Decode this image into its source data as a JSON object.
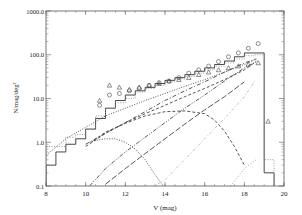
{
  "chart_data": {
    "type": "line",
    "title": "",
    "xlabel": "V (mag)",
    "ylabel": "N/mag/deg²",
    "xlim": [
      8,
      20
    ],
    "ylim": [
      0.1,
      1000.0
    ],
    "yscale": "log",
    "grid": false,
    "legend": null,
    "x_ticks": [
      "8",
      "10",
      "12",
      "14",
      "16",
      "18",
      "20"
    ],
    "y_ticks": [
      "0.1",
      "1.0",
      "10.0",
      "100.0",
      "1000.0"
    ],
    "series": [
      {
        "name": "observed histogram",
        "style": "solid-step",
        "bin_edges": [
          8.0,
          8.5,
          9.0,
          9.5,
          10.0,
          10.5,
          11.0,
          11.5,
          12.0,
          12.5,
          13.0,
          13.5,
          14.0,
          14.5,
          15.0,
          15.5,
          16.0,
          16.5,
          17.0,
          17.5,
          18.0,
          18.5,
          19.0,
          19.5
        ],
        "values": [
          0.3,
          0.6,
          0.9,
          1.2,
          2.0,
          3.5,
          6.0,
          9.0,
          12,
          15,
          18,
          22,
          26,
          30,
          35,
          42,
          50,
          60,
          72,
          90,
          110,
          110,
          0.2
        ]
      },
      {
        "name": "model total histogram",
        "style": "dotted-step",
        "bin_edges": [
          8.0,
          8.5,
          9.0,
          9.5,
          10.0,
          10.5,
          11.0,
          11.5,
          12.0,
          12.5,
          13.0,
          13.5,
          14.0,
          14.5,
          15.0,
          15.5,
          16.0,
          16.5,
          17.0,
          17.5,
          18.0,
          18.5,
          19.0,
          19.5
        ],
        "values": [
          0.8,
          0.8,
          1.3,
          1.5,
          2.0,
          4.0,
          6.0,
          8.0,
          10,
          14,
          17,
          20,
          24,
          28,
          32,
          38,
          45,
          55,
          65,
          80,
          95,
          100,
          0.4
        ]
      },
      {
        "name": "circles",
        "style": "markers-circle",
        "x": [
          10.7,
          11.2,
          11.7,
          12.2,
          12.7,
          13.2,
          13.7,
          14.2,
          14.7,
          15.2,
          15.7,
          16.2,
          16.7,
          17.2,
          17.7,
          18.2,
          18.7
        ],
        "y": [
          7,
          12,
          13,
          15,
          17,
          20,
          23,
          25,
          30,
          38,
          45,
          55,
          70,
          90,
          110,
          140,
          180
        ]
      },
      {
        "name": "triangles",
        "style": "markers-triangle",
        "x": [
          10.7,
          11.2,
          11.7,
          12.2,
          12.7,
          13.2,
          13.7,
          14.2,
          14.7,
          15.2,
          15.7,
          16.2,
          16.7,
          17.2,
          17.7,
          18.2,
          18.7,
          19.2
        ],
        "y": [
          9,
          20,
          18,
          16,
          18,
          20,
          22,
          25,
          27,
          30,
          35,
          40,
          45,
          50,
          55,
          60,
          65,
          3
        ]
      },
      {
        "name": "dotted smooth (total)",
        "style": "dotted",
        "x": [
          8,
          9,
          10,
          11,
          12,
          13,
          14,
          15,
          16,
          17,
          18,
          18.6
        ],
        "y": [
          0.5,
          1.2,
          2.2,
          4,
          6,
          9,
          13,
          19,
          27,
          40,
          60,
          80
        ]
      },
      {
        "name": "dash-dot upper",
        "style": "dashdot",
        "x": [
          10,
          11,
          12,
          13,
          14,
          15,
          16,
          17,
          18,
          18.6
        ],
        "y": [
          0.9,
          1.6,
          2.8,
          5,
          9,
          15,
          24,
          40,
          65,
          80
        ]
      },
      {
        "name": "dashed",
        "style": "dashed",
        "x": [
          10,
          11,
          12,
          13,
          14,
          15,
          16,
          17,
          18,
          18.6
        ],
        "y": [
          0.8,
          1.6,
          2.8,
          4.5,
          7,
          11,
          17,
          27,
          45,
          70
        ]
      },
      {
        "name": "dash-dot-dot",
        "style": "dashdotdot",
        "x": [
          10.2,
          11,
          12,
          13,
          14,
          15,
          16,
          17,
          18,
          18.6
        ],
        "y": [
          0.1,
          0.25,
          0.6,
          1.3,
          2.8,
          6,
          12,
          25,
          50,
          70
        ]
      },
      {
        "name": "long-dash",
        "style": "longdash",
        "x": [
          11,
          12,
          13,
          14,
          15,
          16,
          17,
          18
        ],
        "y": [
          0.11,
          0.25,
          0.55,
          1.2,
          2.6,
          5.5,
          11,
          24
        ]
      },
      {
        "name": "dashed turnover",
        "style": "dashed",
        "x": [
          10.4,
          11,
          12,
          13,
          14,
          15,
          16,
          16.5,
          17,
          17.5,
          18
        ],
        "y": [
          1.1,
          1.7,
          2.7,
          4.0,
          5.0,
          5.2,
          4.5,
          3.2,
          1.8,
          0.8,
          0.3
        ]
      },
      {
        "name": "dotted bump",
        "style": "dotted",
        "x": [
          10.2,
          10.5,
          11,
          11.5,
          12,
          12.5,
          13,
          13.5,
          14
        ],
        "y": [
          1.0,
          1.1,
          1.2,
          1.2,
          1.0,
          0.7,
          0.4,
          0.18,
          0.09
        ]
      },
      {
        "name": "thin dash-dot faint rise",
        "style": "thin-dashdot",
        "x": [
          13.3,
          14,
          15,
          16,
          17,
          18,
          18.6
        ],
        "y": [
          0.09,
          0.14,
          0.4,
          1.2,
          3.5,
          11,
          28
        ]
      },
      {
        "name": "faint dotted low",
        "style": "dotted-faint",
        "x": [
          17.3,
          18,
          18.6
        ],
        "y": [
          0.1,
          0.25,
          0.4
        ]
      }
    ]
  }
}
